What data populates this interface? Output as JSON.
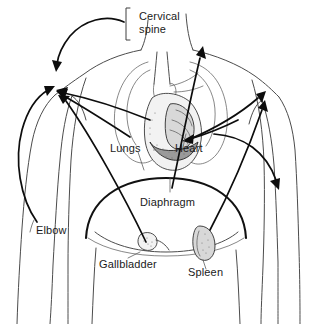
{
  "figure": {
    "kind": "anatomical-diagram",
    "background_color": "#ffffff",
    "line_color": "#0d0d0d",
    "outline_color": "#4c4c4c",
    "label_color": "#1a1a1a",
    "caption_color": "#b9b9b9"
  },
  "labels": {
    "cervical_spine_line1": "Cervical",
    "cervical_spine_line2": "spine",
    "lungs": "Lungs",
    "heart": "Heart",
    "diaphragm": "Diaphragm",
    "elbow": "Elbow",
    "gallbladder": "Gallbladder",
    "spleen": "Spleen"
  },
  "caption": {
    "text": ""
  }
}
